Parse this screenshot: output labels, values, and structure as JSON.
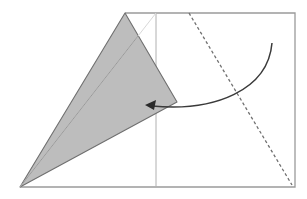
{
  "diagram": {
    "type": "origami-fold-step",
    "colors": {
      "background": "#ffffff",
      "paper_edge": "#9a9a9a",
      "folded_flap_fill": "#bdbdbd",
      "folded_flap_edge": "#6f6f6f",
      "crease_line": "#b0b0b0",
      "valley_fold_dashed": "#707070",
      "arrow": "#3a3a3a"
    },
    "elements": {
      "paper_outline": "paper-sheet",
      "folded_flap": "shaded-triangular-flap",
      "vertical_crease": "vertical-crease-line",
      "diagonal_crease": "diagonal-crease-line",
      "dashed_fold_line": "valley-fold-line",
      "fold_arrow": "curved-fold-arrow"
    }
  }
}
